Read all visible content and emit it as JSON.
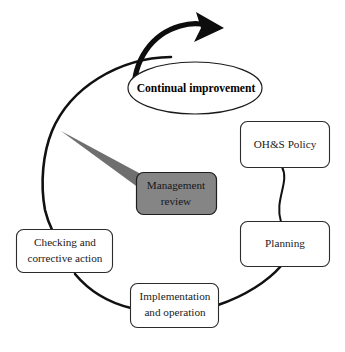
{
  "diagram": {
    "type": "cycle-diagram",
    "background_color": "#ffffff",
    "line_color": "#111111",
    "box_fill": "#ffffff",
    "highlight_fill": "#858585",
    "wedge_fill": "#6f6f6f",
    "nodes": {
      "continual_improvement": {
        "label": "Continual improvement",
        "shape": "ellipse",
        "bold": true
      },
      "ohs_policy": {
        "label": "OH&S Policy",
        "shape": "rounded-rectangle"
      },
      "planning": {
        "label": "Planning",
        "shape": "rounded-rectangle"
      },
      "implementation": {
        "label_line1": "Implementation",
        "label_line2": "and operation",
        "shape": "rounded-rectangle"
      },
      "checking": {
        "label_line1": "Checking and",
        "label_line2": "corrective action",
        "shape": "rounded-rectangle"
      },
      "management_review": {
        "label_line1": "Management",
        "label_line2": "review",
        "shape": "rounded-rectangle",
        "filled": true
      }
    },
    "connectors": [
      {
        "from": "ohs_policy",
        "to": "planning",
        "style": "curve"
      },
      {
        "from": "planning",
        "to": "implementation",
        "style": "arc"
      },
      {
        "from": "implementation",
        "to": "checking",
        "style": "arc"
      },
      {
        "from": "checking",
        "to": "continual_improvement",
        "style": "arc"
      },
      {
        "from": "cycle",
        "to": "management_review",
        "style": "wedge-pointer"
      }
    ],
    "arrow": {
      "name": "continual-improvement-arrow",
      "direction": "clockwise-right"
    }
  }
}
